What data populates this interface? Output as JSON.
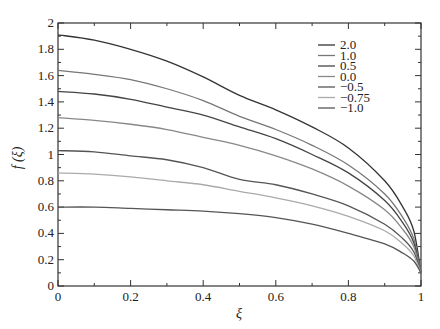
{
  "chart_data": {
    "type": "line",
    "title": "",
    "xlabel": "ξ",
    "ylabel": "f (ξ)",
    "xlim": [
      0,
      1
    ],
    "ylim": [
      0,
      2
    ],
    "xticks": [
      "0",
      "0.2",
      "0.4",
      "0.6",
      "0.8",
      "1"
    ],
    "yticks": [
      "0",
      "0.2",
      "0.4",
      "0.6",
      "0.8",
      "1",
      "1.2",
      "1.4",
      "1.6",
      "1.8",
      "2"
    ],
    "grid": false,
    "legend_position": "upper right",
    "x": [
      0,
      0.1,
      0.2,
      0.3,
      0.4,
      0.5,
      0.6,
      0.7,
      0.8,
      0.9,
      0.95,
      0.98,
      1.0
    ],
    "series": [
      {
        "name": "2.0",
        "color": "#333333",
        "values": [
          1.91,
          1.87,
          1.8,
          1.71,
          1.59,
          1.45,
          1.34,
          1.21,
          1.05,
          0.8,
          0.6,
          0.42,
          0.1
        ]
      },
      {
        "name": "1.0",
        "color": "#777777",
        "values": [
          1.64,
          1.61,
          1.57,
          1.5,
          1.41,
          1.29,
          1.19,
          1.07,
          0.92,
          0.7,
          0.52,
          0.36,
          0.1
        ]
      },
      {
        "name": "0.5",
        "color": "#444444",
        "values": [
          1.48,
          1.46,
          1.42,
          1.36,
          1.3,
          1.21,
          1.12,
          1.0,
          0.86,
          0.65,
          0.48,
          0.33,
          0.1
        ]
      },
      {
        "name": "0.0",
        "color": "#888888",
        "values": [
          1.28,
          1.26,
          1.23,
          1.19,
          1.13,
          1.07,
          0.99,
          0.89,
          0.76,
          0.58,
          0.43,
          0.3,
          0.1
        ]
      },
      {
        "name": "−0.5",
        "color": "#555555",
        "values": [
          1.03,
          1.02,
          0.99,
          0.96,
          0.9,
          0.81,
          0.77,
          0.7,
          0.61,
          0.47,
          0.36,
          0.26,
          0.1
        ]
      },
      {
        "name": "−0.75",
        "color": "#aaaaaa",
        "values": [
          0.86,
          0.85,
          0.83,
          0.8,
          0.77,
          0.72,
          0.67,
          0.61,
          0.53,
          0.42,
          0.32,
          0.23,
          0.1
        ]
      },
      {
        "name": "−1.0",
        "color": "#555555",
        "values": [
          0.6,
          0.6,
          0.59,
          0.58,
          0.57,
          0.55,
          0.52,
          0.47,
          0.4,
          0.32,
          0.25,
          0.19,
          0.1
        ]
      }
    ]
  }
}
